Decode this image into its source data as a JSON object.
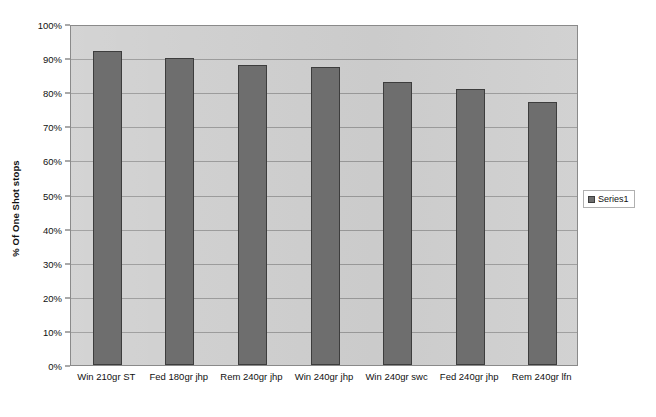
{
  "chart_data": {
    "type": "bar",
    "title": "",
    "subtitle": "",
    "xlabel": "",
    "ylabel": "% Of One Shot stops",
    "categories": [
      "Win 210gr ST",
      "Fed 180gr jhp",
      "Rem 240gr jhp",
      "Win 240gr jhp",
      "Win 240gr swc",
      "Fed 240gr jhp",
      "Rem 240gr lfn"
    ],
    "values": [
      92,
      90,
      88,
      87.5,
      83,
      81,
      77
    ],
    "ylim": [
      0,
      100
    ],
    "ytick_labels": [
      "0%",
      "10%",
      "20%",
      "30%",
      "40%",
      "50%",
      "60%",
      "70%",
      "80%",
      "90%",
      "100%"
    ],
    "ytick_values": [
      0,
      10,
      20,
      30,
      40,
      50,
      60,
      70,
      80,
      90,
      100
    ],
    "grid": true,
    "grid_axis": "y",
    "legend": {
      "position": "right",
      "entries": [
        {
          "label": "Series1",
          "color": "#6e6e6e"
        }
      ]
    },
    "series": [
      {
        "name": "Series1",
        "color": "#6e6e6e",
        "values": [
          92,
          90,
          88,
          87.5,
          83,
          81,
          77
        ]
      }
    ],
    "colors": {
      "bar_fill": "#6e6e6e",
      "bar_border": "#3d3d3d",
      "plot_background": "#cfcfcf",
      "gridline": "#9a9a9a",
      "axis": "#8a8a8a",
      "text": "#111111",
      "page_background": "#ffffff"
    }
  }
}
